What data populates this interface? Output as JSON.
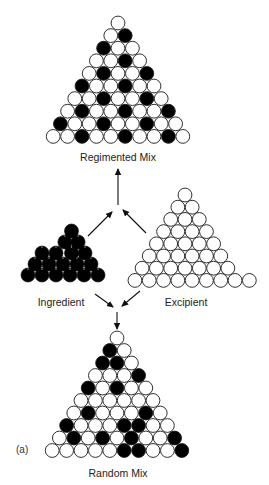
{
  "figure": {
    "panel_label": "(a)",
    "colors": {
      "ingredient": "#000000",
      "excipient": "#ffffff",
      "outline": "#1a1a1a",
      "background": "#ffffff"
    },
    "legend_key": {
      "B": "ingredient (black particle)",
      "W": "excipient (white particle)"
    },
    "regimented_mix": {
      "label": "Regimented Mix",
      "rows": [
        "W",
        "WB",
        "BWW",
        "WWBW",
        "WBWWB",
        "BWWBWW",
        "WWBWWBW",
        "WBWWBWWB",
        "BWWBWWBWW",
        "WWBWWBWWBW"
      ]
    },
    "ingredient": {
      "label": "Ingredient",
      "rows": [
        "B",
        "BB",
        "BBBB",
        "BBBBB",
        "BBBBBB"
      ]
    },
    "excipient": {
      "label": "Excipient",
      "rows": [
        "W",
        "WW",
        "WWW",
        "WWWW",
        "WWWWW",
        "WWWWWW",
        "WWWWWWW",
        "WWWWWWWWW"
      ]
    },
    "random_mix": {
      "label": "Random Mix",
      "rows": [
        "W",
        "BW",
        "BBW",
        "WWWB",
        "BWBWW",
        "WWWWWW",
        "WBWWWBW",
        "BWWWBBWW",
        "WBWBWBWWB",
        "WWWWWBBWWB"
      ]
    },
    "arrows": [
      {
        "from": "ingredient",
        "to": "regimented_mix"
      },
      {
        "from": "excipient",
        "to": "regimented_mix"
      },
      {
        "from": "ingredient",
        "to": "random_mix"
      },
      {
        "from": "excipient",
        "to": "random_mix"
      }
    ]
  }
}
